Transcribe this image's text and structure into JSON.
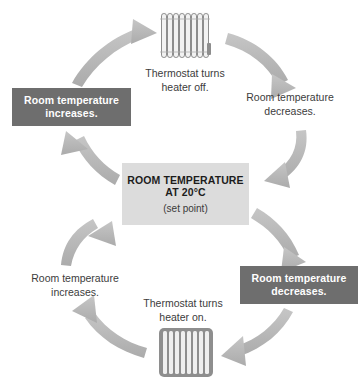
{
  "diagram": {
    "type": "cycle",
    "colors": {
      "dark_box_fill": "#6e6e6e",
      "dark_box_text": "#ffffff",
      "center_box_fill": "#dcdcdc",
      "center_box_text": "#1c1c1c",
      "arrow_fill": "#b6b6b6",
      "plain_text": "#3c3c3c",
      "background": "#ffffff"
    }
  },
  "center": {
    "line1": "ROOM TEMPERATURE",
    "line2": "AT 20°C",
    "line3": "(set point)"
  },
  "nodes": {
    "top_left_box": {
      "line1": "Room temperature",
      "line2": "increases.",
      "style": "dark-filled"
    },
    "right_box": {
      "line1": "Room temperature",
      "line2": "decreases.",
      "style": "dark-filled"
    },
    "top_right_label": {
      "line1": "Room temperature",
      "line2": "decreases.",
      "style": "plain-text"
    },
    "bottom_left_label": {
      "line1": "Room temperature",
      "line2": "increases.",
      "style": "plain-text"
    },
    "heater_off_caption": {
      "line1": "Thermostat turns",
      "line2": "heater off."
    },
    "heater_on_caption": {
      "line1": "Thermostat turns",
      "line2": "heater on."
    }
  },
  "icons": {
    "radiator_top": "radiator-off-icon",
    "radiator_bottom": "radiator-on-icon"
  },
  "arrows": [
    {
      "name": "arrow-to-radiator-off",
      "from": "top_left_box",
      "to": "radiator_top"
    },
    {
      "name": "arrow-radiator-off-to-cooling",
      "from": "radiator_top",
      "to": "top_right_label"
    },
    {
      "name": "arrow-cooling-to-center",
      "from": "top_right_label",
      "to": "center"
    },
    {
      "name": "arrow-center-to-decrease",
      "from": "center",
      "to": "right_box"
    },
    {
      "name": "arrow-decrease-to-radiator-on",
      "from": "right_box",
      "to": "radiator_bottom"
    },
    {
      "name": "arrow-radiator-on-to-warming",
      "from": "radiator_bottom",
      "to": "bottom_left_label"
    },
    {
      "name": "arrow-warming-to-center",
      "from": "bottom_left_label",
      "to": "center"
    },
    {
      "name": "arrow-center-to-increase",
      "from": "center",
      "to": "top_left_box"
    }
  ]
}
